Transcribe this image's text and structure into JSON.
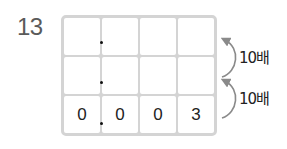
{
  "problem": {
    "number": "13"
  },
  "place_value_grid": {
    "rows": [
      {
        "cells": [
          "",
          "",
          "",
          ""
        ],
        "decimal_point_after_col": 1
      },
      {
        "cells": [
          "",
          "",
          "",
          ""
        ],
        "decimal_point_after_col": 1
      },
      {
        "cells": [
          "0",
          "0",
          "0",
          "3"
        ],
        "decimal_point_after_col": 1
      }
    ]
  },
  "arrows": [
    {
      "label": "10배",
      "from_row": 2,
      "to_row": 1
    },
    {
      "label": "10배",
      "from_row": 1,
      "to_row": 0
    }
  ],
  "colors": {
    "grid_border": "#d4d4d4",
    "arrow": "#8a8a8a",
    "text": "#222222",
    "number": "#5a5a5a"
  }
}
